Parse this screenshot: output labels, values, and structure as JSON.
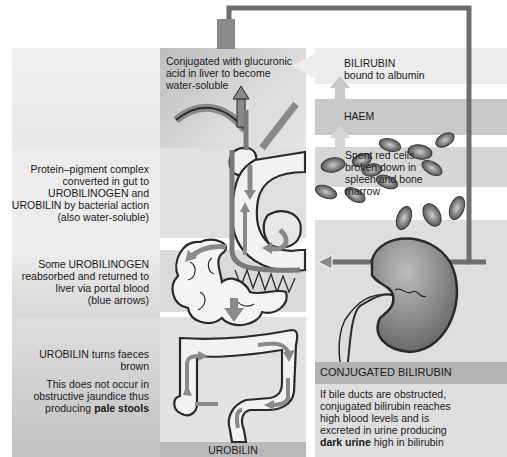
{
  "diagram": {
    "colors": {
      "panel_light": "#e6e6e6",
      "panel_mid": "#d2d2d2",
      "panel_dark": "#b9b9b9",
      "arrow": "#8a8a8a",
      "connector": "#6e6e6e",
      "outline": "#2a2a2a",
      "rbc": "#7a7a7a"
    },
    "labels": {
      "liver": "Conjugated with glucuronic acid in liver to become water-soluble",
      "liver_lines": [
        "Conjugated with glucuronic",
        "acid in liver to become",
        "water-soluble"
      ],
      "bilirubin_lines": [
        "BILIRUBIN",
        "bound to albumin"
      ],
      "haem": "HAEM",
      "rbc_lines": [
        "Spent red cells",
        "broken down in",
        "spleen and bone",
        "marrow"
      ],
      "gut_lines": [
        "Protein–pigment complex",
        "converted in gut to",
        "UROBILINOGEN and",
        "UROBILIN by bacterial action",
        "(also water-soluble)"
      ],
      "portal_lines": [
        "Some UROBILINOGEN",
        "reabsorbed and returned to",
        "liver via portal blood",
        "(blue arrows)"
      ],
      "faeces_lines": [
        "UROBILIN turns faeces",
        "brown"
      ],
      "jaundice_lines": [
        "This does not occur in",
        "obstructive jaundice thus"
      ],
      "jaundice_prefix": "producing ",
      "jaundice_bold": "pale stools",
      "urobilin": "UROBILIN",
      "conjugated_header": "CONJUGATED BILIRUBIN",
      "urine_lines": [
        "If bile ducts are obstructed,",
        "conjugated bilirubin reaches",
        "high blood levels and is",
        "excreted in urine producing"
      ],
      "urine_bold": "dark urine",
      "urine_suffix": " high in bilirubin"
    }
  }
}
